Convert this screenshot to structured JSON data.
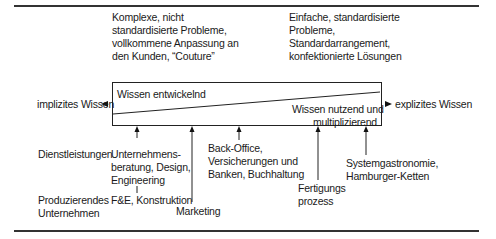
{
  "top_left_text": [
    "Komplexe, nicht",
    "standardisierte Probleme,",
    "vollkommene Anpassung an",
    "den Kunden, “Couture”"
  ],
  "top_right_text": [
    "Einfache, standardisierte",
    "Probleme,",
    "Standardarrangement,",
    "konfektionierte Lösungen"
  ],
  "box": {
    "upper_label": "Wissen entwickelnd",
    "lower_label_line1": "Wissen nutzend und",
    "lower_label_line2": "multiplizierend"
  },
  "axis": {
    "left_label": "implizites Wissen",
    "right_label": "explizites Wissen"
  },
  "rows": {
    "services": "Dienstleistungen",
    "manufacturing_line1": "Produzierendes",
    "manufacturing_line2": "Unternehmen"
  },
  "items": {
    "consulting": [
      "Unternehmens-",
      "beratung, Design,",
      "Engineering"
    ],
    "rnd": "F&E, Konstruktion",
    "marketing": "Marketing",
    "backoffice": [
      "Back-Office,",
      "Versicherungen und",
      "Banken, Buchhaltung"
    ],
    "production": [
      "Fertigungs",
      "prozess"
    ],
    "systemgastro": [
      "Systemgastronomie,",
      "Hamburger-Ketten"
    ]
  }
}
